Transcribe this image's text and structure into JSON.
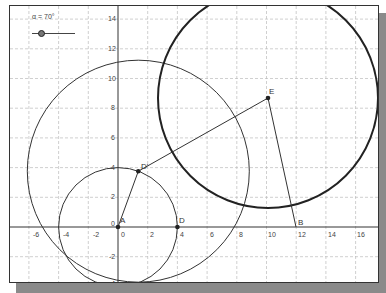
{
  "slider": {
    "name": "α",
    "label": "α = 70°",
    "value_deg": 70
  },
  "axes": {
    "x_ticks": [
      "-6",
      "-4",
      "-2",
      "0",
      "2",
      "4",
      "6",
      "8",
      "10",
      "12",
      "14",
      "16"
    ],
    "y_ticks": [
      "14",
      "12",
      "10",
      "8",
      "6",
      "4",
      "2",
      "0",
      "-2",
      "-4"
    ],
    "grid": true
  },
  "points": {
    "A": {
      "label": "A",
      "x": 0,
      "y": 0
    },
    "D": {
      "label": "D",
      "x": 4,
      "y": 0
    },
    "D_prime": {
      "label": "D'",
      "x": 1.37,
      "y": 3.76
    },
    "E": {
      "label": "E",
      "x": 10.1,
      "y": 8.7
    },
    "B": {
      "label": "B",
      "x": 12,
      "y": 0
    }
  },
  "objects": [
    {
      "type": "circle",
      "center": "A",
      "radius": 4
    },
    {
      "type": "circle",
      "center": "D'",
      "radius": 7.5
    },
    {
      "type": "circle",
      "center": "E",
      "radius": 7.4,
      "thick": true
    },
    {
      "type": "segment",
      "from": "A",
      "to": "D'"
    },
    {
      "type": "segment",
      "from": "D'",
      "to": "E"
    },
    {
      "type": "segment",
      "from": "E",
      "to": "B"
    }
  ],
  "colors": {
    "axis": "#333333",
    "grid": "#bbbbbb",
    "curve": "#333333",
    "shadow": "#8a8a8a"
  }
}
